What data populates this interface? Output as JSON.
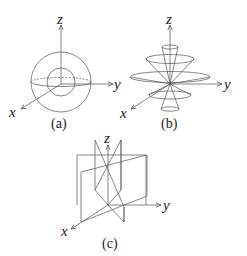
{
  "figures": [
    {
      "id": "a",
      "caption": "(a)",
      "description": "Two concentric spheres with equatorial ellipse",
      "axes": {
        "z": "z",
        "y": "y",
        "x": "x"
      }
    },
    {
      "id": "b",
      "caption": "(b)",
      "description": "Nested double cones with horizontal circular sections",
      "axes": {
        "z": "z",
        "y": "y",
        "x": "x"
      }
    },
    {
      "id": "c",
      "caption": "(c)",
      "description": "Intersecting vertical planes through z-axis",
      "axes": {
        "z": "z",
        "y": "y",
        "x": "x"
      }
    }
  ],
  "colors": {
    "stroke": "#555555",
    "text": "#222222",
    "background": "#ffffff"
  }
}
